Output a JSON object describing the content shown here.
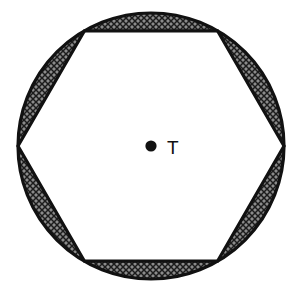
{
  "figure": {
    "kind": "geometry-diagram",
    "background_color": "#ffffff",
    "stroke_color": "#111111",
    "hatch_color": "#3a3a3a",
    "hatch_fill_color": "#7a7a7a",
    "circle": {
      "center_x": 151,
      "center_y": 146,
      "radius": 133,
      "stroke_width": 3.2
    },
    "hexagon": {
      "sides": 6,
      "circumradius": 133,
      "rotation_degrees": 0,
      "stroke_width": 3.2,
      "fill_color": "#ffffff",
      "vertices": [
        {
          "name": "right",
          "x": 284,
          "y": 146
        },
        {
          "name": "top-right",
          "x": 217.5,
          "y": 30.8
        },
        {
          "name": "top-left",
          "x": 84.5,
          "y": 30.8
        },
        {
          "name": "left",
          "x": 18,
          "y": 146
        },
        {
          "name": "bottom-left",
          "x": 84.5,
          "y": 261.2
        },
        {
          "name": "bottom-right",
          "x": 217.5,
          "y": 261.2
        }
      ]
    },
    "center_point": {
      "x": 151,
      "y": 146,
      "radius": 5.6,
      "fill_color": "#111111"
    },
    "center_label": {
      "text": "T",
      "x": 167,
      "y": 154,
      "font_size": 19,
      "color": "#111111"
    },
    "segment_count": 6
  }
}
